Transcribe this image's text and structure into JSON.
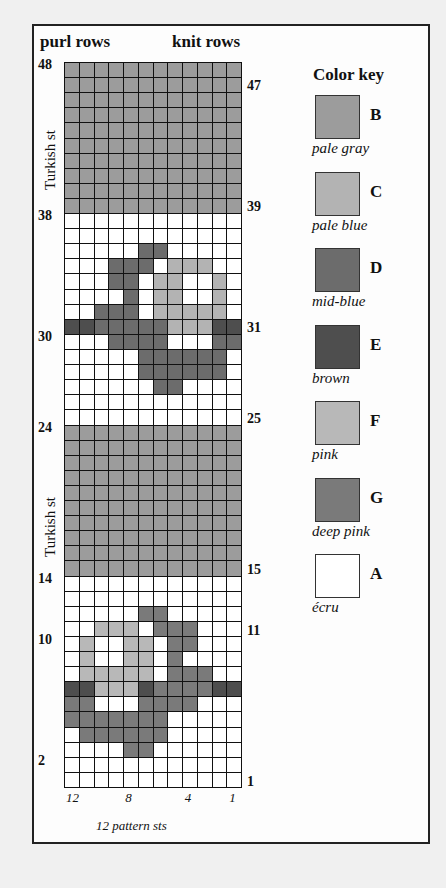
{
  "header": {
    "left": "purl rows",
    "right": "knit rows"
  },
  "side_labels": {
    "upper": "Turkish st",
    "lower": "Turkish st"
  },
  "left_row_numbers": [
    {
      "label": "48",
      "row": 48
    },
    {
      "label": "38",
      "row": 38
    },
    {
      "label": "30",
      "row": 30
    },
    {
      "label": "24",
      "row": 24
    },
    {
      "label": "14",
      "row": 14
    },
    {
      "label": "10",
      "row": 10
    },
    {
      "label": "2",
      "row": 2
    }
  ],
  "right_row_numbers": [
    {
      "label": "47",
      "row": 47
    },
    {
      "label": "39",
      "row": 39
    },
    {
      "label": "31",
      "row": 31
    },
    {
      "label": "25",
      "row": 25
    },
    {
      "label": "15",
      "row": 15
    },
    {
      "label": "11",
      "row": 11
    },
    {
      "label": "1",
      "row": 1
    }
  ],
  "column_numbers": [
    {
      "label": "12",
      "col": 12
    },
    {
      "label": "8",
      "col": 8
    },
    {
      "label": "4",
      "col": 4
    },
    {
      "label": "1",
      "col": 1
    }
  ],
  "footer": "12 pattern sts",
  "color_key": {
    "title": "Color key",
    "items": [
      {
        "letter": "B",
        "name": "pale gray",
        "color": "#9c9c9c"
      },
      {
        "letter": "C",
        "name": "pale blue",
        "color": "#b3b3b3"
      },
      {
        "letter": "D",
        "name": "mid-blue",
        "color": "#6c6c6c"
      },
      {
        "letter": "E",
        "name": "brown",
        "color": "#4e4e4e"
      },
      {
        "letter": "F",
        "name": "pink",
        "color": "#b8b8b8"
      },
      {
        "letter": "G",
        "name": "deep pink",
        "color": "#7a7a7a"
      },
      {
        "letter": "A",
        "name": "écru",
        "color": "#ffffff"
      }
    ]
  },
  "chart_grid": {
    "columns": 12,
    "rows_top_to_bottom_from_48": [
      "BBBBBBBBBBBB",
      "BBBBBBBBBBBB",
      "BBBBBBBBBBBB",
      "BBBBBBBBBBBB",
      "BBBBBBBBBBBB",
      "BBBBBBBBBBBB",
      "BBBBBBBBBBBB",
      "BBBBBBBBBBBB",
      "BBBBBBBBBBBB",
      "BBBBBBBBBBBB",
      "AAAAAAAAAAAA",
      "AAAAAAAAAAAA",
      "AAAAADDAAAAA",
      "AAADDDACCCAA",
      "AAADDACCAACA",
      "AAAADACCAACA",
      "AADDDACCCCCA",
      "EEDDDDDCCCEE",
      "AAADDDDAAADD",
      "AAAAADDDDDDA",
      "AAAAADDDDDDA",
      "AAAAAADDAAAA",
      "AAAAAAAAAAAA",
      "AAAAAAAAAAAA",
      "BBBBBBBBBBBB",
      "BBBBBBBBBBBB",
      "BBBBBBBBBBBB",
      "BBBBBBBBBBBB",
      "BBBBBBBBBBBB",
      "BBBBBBBBBBBB",
      "BBBBBBBBBBBB",
      "BBBBBBBBBBBB",
      "BBBBBBBBBBBB",
      "BBBBBBBBBBBB",
      "AAAAAAAAAAAA",
      "AAAAAAAAAAAA",
      "AAAAAGGAAAAA",
      "AAFFFAGGGAAA",
      "AFAAFFAGGAAA",
      "AFAAFFAGAAAA",
      "AFFFFFAGGGAA",
      "EEFFFEGGGGEE",
      "GGAAAGGGGAAA",
      "GGGGGGGAAAAA",
      "AGGGGGGAAAAA",
      "AAAAGGAAAAAA",
      "AAAAAAAAAAAA",
      "AAAAAAAAAAAA"
    ]
  }
}
